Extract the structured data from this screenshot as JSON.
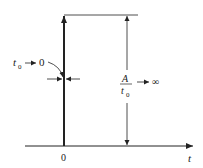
{
  "diagram": {
    "type": "impulse-function-limit",
    "colors": {
      "ink": "#222222",
      "background": "#ffffff"
    },
    "axis": {
      "label": "t",
      "origin_label": "0"
    },
    "width_annotation": {
      "var": "t",
      "sub": "0",
      "arrow": "→",
      "limit": "0"
    },
    "height_annotation": {
      "numerator": "A",
      "denom_var": "t",
      "denom_sub": "0",
      "arrow": "→",
      "limit": "∞"
    }
  }
}
